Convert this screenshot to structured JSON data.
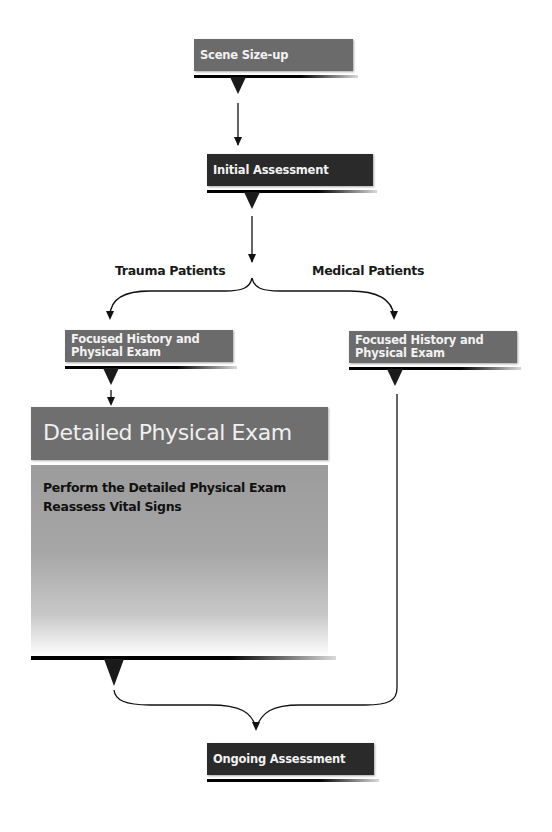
{
  "diagram": {
    "type": "flowchart",
    "nodes": {
      "scene_sizeup": {
        "label": "Scene Size-up",
        "fill": "#6b6b6b"
      },
      "initial_assessment": {
        "label": "Initial Assessment",
        "fill": "#2a2a2a"
      },
      "focused_trauma": {
        "label_line1": "Focused History and",
        "label_line2": "Physical Exam",
        "fill": "#6b6b6b"
      },
      "focused_medical": {
        "label_line1": "Focused History and",
        "label_line2": "Physical Exam",
        "fill": "#6b6b6b"
      },
      "detailed_exam": {
        "title": "Detailed Physical Exam",
        "items": [
          "Perform the Detailed Physical Exam",
          "Reassess Vital Signs"
        ],
        "header_fill": "#6f6f6f"
      },
      "ongoing_assessment": {
        "label": "Ongoing Assessment",
        "fill": "#2a2a2a"
      }
    },
    "branches": {
      "left": "Trauma Patients",
      "right": "Medical Patients"
    },
    "edges": [
      {
        "from": "Scene Size-up",
        "to": "Initial Assessment"
      },
      {
        "from": "Initial Assessment",
        "to": "Focused History and Physical Exam (Trauma)",
        "label": "Trauma Patients"
      },
      {
        "from": "Initial Assessment",
        "to": "Focused History and Physical Exam (Medical)",
        "label": "Medical Patients"
      },
      {
        "from": "Focused History and Physical Exam (Trauma)",
        "to": "Detailed Physical Exam"
      },
      {
        "from": "Detailed Physical Exam",
        "to": "Ongoing Assessment"
      },
      {
        "from": "Focused History and Physical Exam (Medical)",
        "to": "Ongoing Assessment"
      }
    ]
  }
}
